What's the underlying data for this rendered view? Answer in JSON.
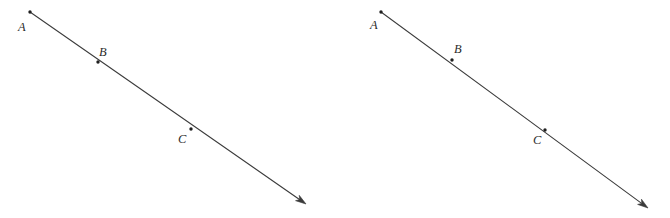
{
  "figure": {
    "kind": "geometry-ray-diagram-pair",
    "background_color": "#ffffff",
    "stroke_color": "#3b3b3b",
    "label_color": "#2b2b2b",
    "point_color": "#1f1f1f",
    "width": 670,
    "height": 218,
    "diagrams": [
      {
        "id": "left",
        "name": "left-ray-diagram",
        "ray": {
          "x1": 30,
          "y1": 12,
          "x2": 306,
          "y2": 204
        },
        "arrow": {
          "tip_x": 306,
          "tip_y": 204,
          "size": 11
        },
        "points": [
          {
            "label": "A",
            "px": 30,
            "py": 12,
            "lx": 18,
            "ly": 31
          },
          {
            "label": "B",
            "px": 98,
            "py": 62,
            "lx": 99,
            "ly": 56
          },
          {
            "label": "C",
            "px": 191,
            "py": 129,
            "lx": 178,
            "ly": 143
          }
        ]
      },
      {
        "id": "right",
        "name": "right-ray-diagram",
        "ray": {
          "x1": 381,
          "y1": 12,
          "x2": 648,
          "y2": 208
        },
        "arrow": {
          "tip_x": 648,
          "tip_y": 208,
          "size": 11
        },
        "points": [
          {
            "label": "A",
            "px": 381,
            "py": 12,
            "lx": 370,
            "ly": 29
          },
          {
            "label": "B",
            "px": 452,
            "py": 60,
            "lx": 454,
            "ly": 53
          },
          {
            "label": "C",
            "px": 545,
            "py": 130,
            "lx": 533,
            "ly": 144
          }
        ]
      }
    ]
  }
}
